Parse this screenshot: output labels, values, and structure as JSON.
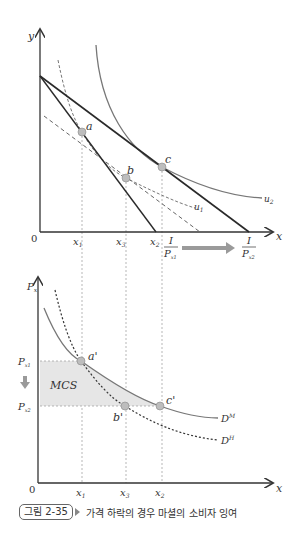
{
  "top_panel": {
    "axis_labels": {
      "y": "y",
      "x": "x",
      "origin": "0"
    },
    "x_ticks": [
      "x1",
      "x3",
      "x2"
    ],
    "x_tick_display": {
      "x1": "x",
      "x1_sub": "1",
      "x3": "x",
      "x3_sub": "3",
      "x2": "x",
      "x2_sub": "2"
    },
    "budget_intercepts": {
      "first": {
        "num": "I",
        "den": "P",
        "den_sub": "x1"
      },
      "second": {
        "num": "I",
        "den": "P",
        "den_sub": "x2"
      }
    },
    "points": {
      "a": "a",
      "b": "b",
      "c": "c"
    },
    "curves": {
      "u1": "u",
      "u1_sub": "1",
      "u2": "u",
      "u2_sub": "2"
    }
  },
  "bottom_panel": {
    "axis_labels": {
      "y": "P",
      "y_sub": "x",
      "x": "x",
      "origin": "0"
    },
    "price_levels": {
      "p1": "P",
      "p1_sub": "x1",
      "p2": "P",
      "p2_sub": "x2"
    },
    "x_ticks": {
      "x1": "x",
      "x1_sub": "1",
      "x3": "x",
      "x3_sub": "3",
      "x2": "x",
      "x2_sub": "2"
    },
    "points": {
      "a": "a'",
      "b": "b'",
      "c": "c'"
    },
    "area_label": "MCS",
    "curves": {
      "dm": "D",
      "dm_sup": "M",
      "dh": "D",
      "dh_sup": "H"
    }
  },
  "caption": {
    "figure_number": "그림 2-35",
    "title": "가격 하락의 경우 마셜의 소비자 잉여"
  },
  "colors": {
    "axis": "#333333",
    "budget_line": "#2a2a2a",
    "indifference_curve": "#777777",
    "point_fill": "#bdbdbd",
    "mcs_fill": "#e6e6e6",
    "arrow": "#9a9a9a"
  }
}
